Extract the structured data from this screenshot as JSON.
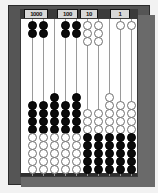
{
  "screenshot": {
    "width": 158,
    "height": 193,
    "description": "Photograph-style image of a ten-rod counting abacus with black and white beads"
  },
  "colors": {
    "frame_outer": "#555555",
    "frame_bevel": "#6a6a6a",
    "field_background": "#ffffff",
    "label_bar": "#3b3b3b",
    "label_plaque": "#d8d8d8",
    "bead_dark": "#0b0b0b",
    "bead_light": "#ffffff",
    "bead_light_outline": "#6f6f6f",
    "rod": "#9a9a9a"
  },
  "place_labels": [
    {
      "text": "1000",
      "rod_index": 0,
      "left": 4,
      "width": 24
    },
    {
      "text": "100",
      "rod_index": 3,
      "left": 37,
      "width": 21
    },
    {
      "text": "10",
      "rod_index": 5,
      "left": 60,
      "width": 18
    },
    {
      "text": "1",
      "rod_index": 8,
      "left": 90,
      "width": 20
    }
  ],
  "abacus": {
    "rod_count": 10,
    "beads_per_rod": 11,
    "rod_positions": [
      7,
      18,
      29,
      40,
      51,
      62,
      73,
      84,
      95,
      106
    ],
    "rods": [
      {
        "index": 0,
        "label": "1000",
        "top_beads": [
          {
            "color": "dark",
            "y": 2
          },
          {
            "color": "dark",
            "y": 10
          }
        ],
        "bottom_beads": [
          {
            "color": "dark",
            "y": 82
          },
          {
            "color": "dark",
            "y": 90
          },
          {
            "color": "dark",
            "y": 98
          },
          {
            "color": "dark",
            "y": 106
          },
          {
            "color": "light",
            "y": 114
          },
          {
            "color": "light",
            "y": 122
          },
          {
            "color": "light",
            "y": 130
          },
          {
            "color": "light",
            "y": 138
          },
          {
            "color": "light",
            "y": 146
          }
        ]
      },
      {
        "index": 1,
        "label": "",
        "top_beads": [
          {
            "color": "dark",
            "y": 2
          },
          {
            "color": "dark",
            "y": 10
          }
        ],
        "bottom_beads": [
          {
            "color": "dark",
            "y": 82
          },
          {
            "color": "dark",
            "y": 90
          },
          {
            "color": "dark",
            "y": 98
          },
          {
            "color": "dark",
            "y": 106
          },
          {
            "color": "light",
            "y": 114
          },
          {
            "color": "light",
            "y": 122
          },
          {
            "color": "light",
            "y": 130
          },
          {
            "color": "light",
            "y": 138
          },
          {
            "color": "light",
            "y": 146
          }
        ]
      },
      {
        "index": 2,
        "label": "",
        "top_beads": [],
        "bottom_beads": [
          {
            "color": "dark",
            "y": 74
          },
          {
            "color": "dark",
            "y": 82
          },
          {
            "color": "dark",
            "y": 90
          },
          {
            "color": "dark",
            "y": 98
          },
          {
            "color": "dark",
            "y": 106
          },
          {
            "color": "light",
            "y": 114
          },
          {
            "color": "light",
            "y": 122
          },
          {
            "color": "light",
            "y": 130
          },
          {
            "color": "light",
            "y": 138
          },
          {
            "color": "light",
            "y": 146
          }
        ]
      },
      {
        "index": 3,
        "label": "100",
        "top_beads": [
          {
            "color": "dark",
            "y": 2
          },
          {
            "color": "dark",
            "y": 10
          }
        ],
        "bottom_beads": [
          {
            "color": "dark",
            "y": 82
          },
          {
            "color": "dark",
            "y": 90
          },
          {
            "color": "dark",
            "y": 98
          },
          {
            "color": "dark",
            "y": 106
          },
          {
            "color": "light",
            "y": 114
          },
          {
            "color": "light",
            "y": 122
          },
          {
            "color": "light",
            "y": 130
          },
          {
            "color": "light",
            "y": 138
          },
          {
            "color": "light",
            "y": 146
          }
        ]
      },
      {
        "index": 4,
        "label": "",
        "top_beads": [
          {
            "color": "dark",
            "y": 2
          },
          {
            "color": "dark",
            "y": 10
          }
        ],
        "bottom_beads": [
          {
            "color": "dark",
            "y": 74
          },
          {
            "color": "dark",
            "y": 82
          },
          {
            "color": "dark",
            "y": 90
          },
          {
            "color": "dark",
            "y": 98
          },
          {
            "color": "dark",
            "y": 106
          },
          {
            "color": "light",
            "y": 114
          },
          {
            "color": "light",
            "y": 122
          },
          {
            "color": "light",
            "y": 130
          },
          {
            "color": "light",
            "y": 138
          },
          {
            "color": "light",
            "y": 146
          }
        ]
      },
      {
        "index": 5,
        "label": "10",
        "top_beads": [
          {
            "color": "light",
            "y": 2
          },
          {
            "color": "light",
            "y": 10
          },
          {
            "color": "light",
            "y": 18
          }
        ],
        "bottom_beads": [
          {
            "color": "light",
            "y": 90
          },
          {
            "color": "light",
            "y": 98
          },
          {
            "color": "light",
            "y": 106
          },
          {
            "color": "dark",
            "y": 114
          },
          {
            "color": "dark",
            "y": 122
          },
          {
            "color": "dark",
            "y": 130
          },
          {
            "color": "dark",
            "y": 138
          },
          {
            "color": "dark",
            "y": 146
          }
        ]
      },
      {
        "index": 6,
        "label": "",
        "top_beads": [
          {
            "color": "light",
            "y": 2
          },
          {
            "color": "light",
            "y": 10
          },
          {
            "color": "light",
            "y": 18
          }
        ],
        "bottom_beads": [
          {
            "color": "light",
            "y": 90
          },
          {
            "color": "light",
            "y": 98
          },
          {
            "color": "light",
            "y": 106
          },
          {
            "color": "dark",
            "y": 114
          },
          {
            "color": "dark",
            "y": 122
          },
          {
            "color": "dark",
            "y": 130
          },
          {
            "color": "dark",
            "y": 138
          },
          {
            "color": "dark",
            "y": 146
          }
        ]
      },
      {
        "index": 7,
        "label": "",
        "top_beads": [],
        "bottom_beads": [
          {
            "color": "light",
            "y": 74
          },
          {
            "color": "light",
            "y": 82
          },
          {
            "color": "light",
            "y": 90
          },
          {
            "color": "light",
            "y": 98
          },
          {
            "color": "light",
            "y": 106
          },
          {
            "color": "dark",
            "y": 114
          },
          {
            "color": "dark",
            "y": 122
          },
          {
            "color": "dark",
            "y": 130
          },
          {
            "color": "dark",
            "y": 138
          },
          {
            "color": "dark",
            "y": 146
          }
        ]
      },
      {
        "index": 8,
        "label": "1",
        "top_beads": [
          {
            "color": "light",
            "y": 2
          }
        ],
        "bottom_beads": [
          {
            "color": "light",
            "y": 82
          },
          {
            "color": "light",
            "y": 90
          },
          {
            "color": "light",
            "y": 98
          },
          {
            "color": "light",
            "y": 106
          },
          {
            "color": "dark",
            "y": 114
          },
          {
            "color": "dark",
            "y": 122
          },
          {
            "color": "dark",
            "y": 130
          },
          {
            "color": "dark",
            "y": 138
          },
          {
            "color": "dark",
            "y": 146
          }
        ]
      },
      {
        "index": 9,
        "label": "",
        "top_beads": [
          {
            "color": "light",
            "y": 2
          }
        ],
        "bottom_beads": [
          {
            "color": "light",
            "y": 82
          },
          {
            "color": "light",
            "y": 90
          },
          {
            "color": "light",
            "y": 98
          },
          {
            "color": "light",
            "y": 106
          },
          {
            "color": "dark",
            "y": 114
          },
          {
            "color": "dark",
            "y": 122
          },
          {
            "color": "dark",
            "y": 130
          },
          {
            "color": "dark",
            "y": 138
          },
          {
            "color": "dark",
            "y": 146
          }
        ]
      }
    ]
  }
}
